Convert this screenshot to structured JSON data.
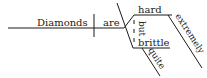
{
  "diagram": {
    "type": "sentence-diagram",
    "sentence": "Diamonds are hard but extremely brittle quite",
    "subject": "Diamonds",
    "verb": "are",
    "complements": [
      "hard",
      "brittle"
    ],
    "conjunction": "but",
    "modifiers": {
      "hard": "extremely",
      "brittle": "quite"
    },
    "line_color": "#1a1a1a"
  }
}
